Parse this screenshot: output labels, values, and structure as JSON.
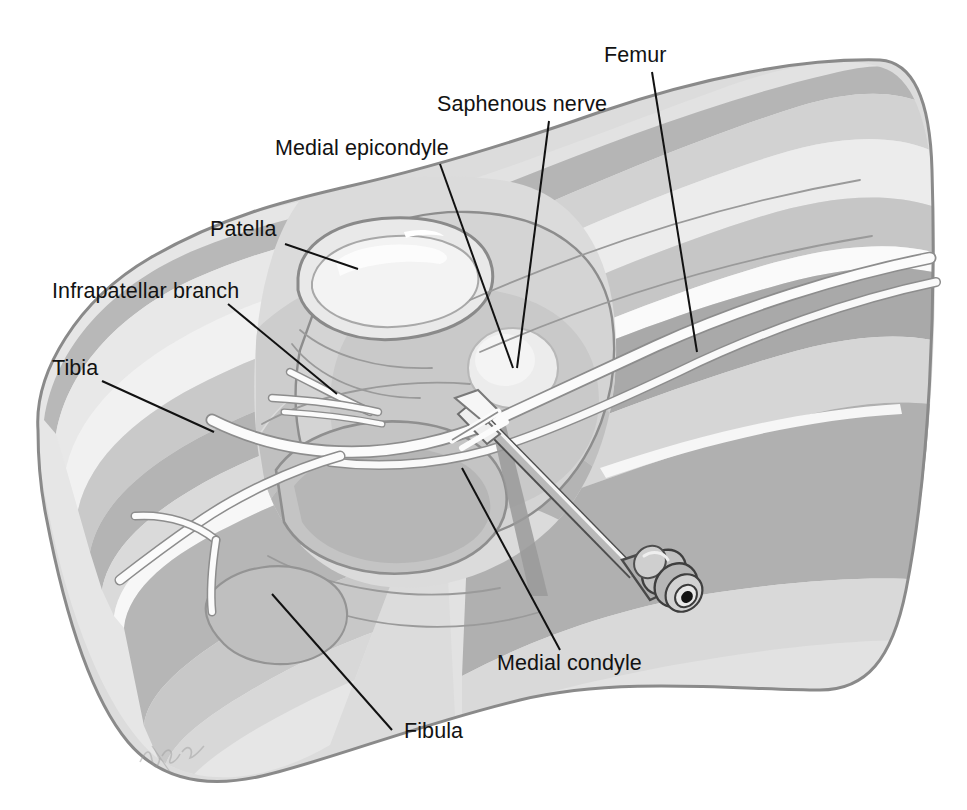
{
  "figure": {
    "background_color": "#ffffff",
    "width": 967,
    "height": 810,
    "artist_signature": "Hudak"
  },
  "palette": {
    "ink": "#111111",
    "outline": "#8c8c8c",
    "outline_dark": "#707070",
    "skin_light": "#e4e4e4",
    "tone_1": "#efefef",
    "tone_2": "#dedede",
    "tone_3": "#cfcfcf",
    "tone_4": "#bdbdbd",
    "tone_5": "#ababab",
    "tone_6": "#9b9b9b",
    "highlight": "#f8f8f8",
    "nerve_white": "#fbfbfb",
    "needle_steel": "#9d9d9d",
    "needle_hub": "#8f8f8f",
    "shadow": "#8f8f8f"
  },
  "labels": [
    {
      "id": "femur",
      "text": "Femur",
      "text_x": 604,
      "text_y": 62,
      "anchor": "start",
      "leader": "M 652 72 L 697 352"
    },
    {
      "id": "saphenous-nerve",
      "text": "Saphenous nerve",
      "text_x": 437,
      "text_y": 111,
      "anchor": "start",
      "leader": "M 549 121 L 517 368"
    },
    {
      "id": "medial-epicondyle",
      "text": "Medial epicondyle",
      "text_x": 275,
      "text_y": 155,
      "anchor": "start",
      "leader": "M 440 164 L 513 368"
    },
    {
      "id": "patella",
      "text": "Patella",
      "text_x": 210,
      "text_y": 236,
      "anchor": "start",
      "leader": "M 285 244 L 358 269"
    },
    {
      "id": "infrapatellar-branch",
      "text": "Infrapatellar branch",
      "text_x": 52,
      "text_y": 298,
      "anchor": "start",
      "leader": "M 228 304 L 337 394"
    },
    {
      "id": "tibia",
      "text": "Tibia",
      "text_x": 52,
      "text_y": 375,
      "anchor": "start",
      "leader": "M 102 381 L 214 432"
    },
    {
      "id": "medial-condyle",
      "text": "Medial condyle",
      "text_x": 497,
      "text_y": 670,
      "anchor": "start",
      "leader": "M 462 468 L 560 650"
    },
    {
      "id": "fibula",
      "text": "Fibula",
      "text_x": 404,
      "text_y": 738,
      "anchor": "start",
      "leader": "M 272 594 L 392 730"
    }
  ],
  "anatomy": {
    "structures": [
      "skin-cross-section-tibia-lobe",
      "skin-cross-section-thigh-lobe",
      "patella",
      "medial-epicondyle",
      "medial-condyle",
      "femur-shaft",
      "tibial-plateau",
      "fibula-head",
      "saphenous-nerve-trunk",
      "infrapatellar-branch",
      "muscle-fascia-bands"
    ]
  },
  "needle": {
    "name": "block-needle",
    "description": "Hypodermic block needle with luer-lock hub entering medial knee toward saphenous nerve",
    "tip_x": 487,
    "tip_y": 424,
    "hub_x": 648,
    "hub_y": 588,
    "angle_deg": 45
  }
}
